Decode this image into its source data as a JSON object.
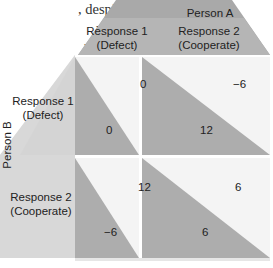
{
  "text_excerpt": {
    "lines": [
      ", despite the fact",
      " mutual non-",
      "y students",
      "out-"
    ]
  },
  "matrix": {
    "column_player": "Person A",
    "row_player": "Person B",
    "columns": [
      "Response 1\n(Defect)",
      "Response 2\n(Cooperate)"
    ],
    "column_labels": [
      {
        "line1": "Response 1",
        "line2": "(Defect)"
      },
      {
        "line1": "Response 2",
        "line2": "(Cooperate)"
      }
    ],
    "row_labels": [
      {
        "line1": "Response 1",
        "line2": "(Defect)"
      },
      {
        "line1": "Response 2",
        "line2": "(Cooperate)"
      }
    ],
    "cells": [
      [
        {
          "a": "0",
          "b": "0"
        },
        {
          "a": "−6",
          "b": "12"
        }
      ],
      [
        {
          "a": "12",
          "b": "−6"
        },
        {
          "a": "6",
          "b": "6"
        }
      ]
    ]
  },
  "colors": {
    "header_dark": "#a9a9a9",
    "header_light": "#c4c4c4",
    "side_light": "#dadada",
    "triangle": "#afafaf",
    "cell_bg": "#f4f4f4"
  }
}
